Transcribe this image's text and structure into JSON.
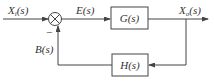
{
  "diagram": {
    "type": "closed-loop control block diagram",
    "signals": {
      "input": {
        "base": "X",
        "sub": "i",
        "arg": "(s)"
      },
      "error": {
        "text": "E(s)"
      },
      "output": {
        "base": "X",
        "sub": "o",
        "arg": "(s)"
      },
      "feedback": {
        "text": "B(s)"
      }
    },
    "blocks": {
      "forward": {
        "text": "G(s)"
      },
      "feedback": {
        "text": "H(s)"
      }
    },
    "summing_junction": {
      "feedback_sign": "−"
    }
  }
}
